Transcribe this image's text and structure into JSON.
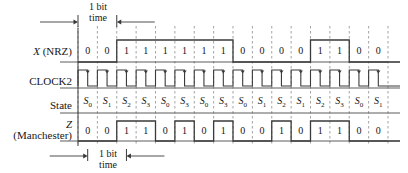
{
  "figure": {
    "top_annotation": {
      "line1": "1 bit",
      "line2": "time"
    },
    "bottom_annotation": {
      "line1": "1 bit",
      "line2": "time"
    },
    "colors": {
      "waveform": "#3a3a3a",
      "axis": "#4a4a4a",
      "grid": "#8c8c8c",
      "text": "#161616"
    },
    "rows": [
      {
        "id": "x-nrz",
        "label_html": "<span class='ital'>X</span> (NRZ)",
        "label_text": "X (NRZ)",
        "type": "waveform-binary"
      },
      {
        "id": "clock2",
        "label_html": "CLOCK2",
        "label_text": "CLOCK2",
        "type": "clock"
      },
      {
        "id": "state",
        "label_html": "State",
        "label_text": "State",
        "type": "state"
      },
      {
        "id": "z-manchester",
        "label_html": "<span class='ital'>Z</span><br>(Manchester)",
        "label_text": "Z (Manchester)",
        "type": "waveform-binary"
      }
    ],
    "bit_count": 16
  },
  "chart_data": {
    "type": "line",
    "xlabel": "1 bit time",
    "ylabel": "",
    "grid": true,
    "legend": "none",
    "categories": [
      "0",
      "1",
      "2",
      "3",
      "4",
      "5",
      "6",
      "7",
      "8",
      "9",
      "10",
      "11",
      "12",
      "13",
      "14",
      "15"
    ],
    "series": [
      {
        "name": "X (NRZ)",
        "values": [
          0,
          0,
          1,
          1,
          1,
          1,
          1,
          1,
          0,
          0,
          0,
          0,
          1,
          1,
          0,
          0
        ]
      },
      {
        "name": "CLOCK2",
        "values": [
          1,
          1,
          1,
          1,
          1,
          1,
          1,
          1,
          1,
          1,
          1,
          1,
          1,
          1,
          1,
          1
        ]
      },
      {
        "name": "State",
        "values": [
          "S0",
          "S1",
          "S2",
          "S3",
          "S0",
          "S3",
          "S0",
          "S3",
          "S0",
          "S1",
          "S2",
          "S1",
          "S2",
          "S3",
          "S0",
          "S1"
        ]
      },
      {
        "name": "Z (Manchester)",
        "values": [
          0,
          0,
          1,
          1,
          0,
          1,
          0,
          1,
          0,
          0,
          1,
          0,
          1,
          1,
          0,
          0
        ]
      }
    ],
    "state_subscripts": [
      0,
      1,
      2,
      3,
      0,
      3,
      0,
      3,
      0,
      1,
      2,
      1,
      2,
      3,
      0,
      1
    ],
    "annotations": [
      "1 bit time",
      "1 bit time"
    ]
  }
}
